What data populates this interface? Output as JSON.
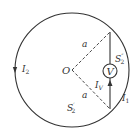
{
  "diagram": {
    "center_label": "O",
    "radius_labels": [
      "a",
      "a"
    ],
    "currents": {
      "left_arc": "I",
      "left_arc_sub": "2",
      "right_arc": "I",
      "right_arc_sub": "1",
      "voltmeter": "I",
      "voltmeter_sub": "V"
    },
    "regions": {
      "upper": "S",
      "upper_sup": "″",
      "upper_sub": "2",
      "lower": "S",
      "lower_sup": "′",
      "lower_sub": "2"
    },
    "meter_label": "V",
    "colors": {
      "stroke": "#333333",
      "background": "#ffffff"
    }
  }
}
